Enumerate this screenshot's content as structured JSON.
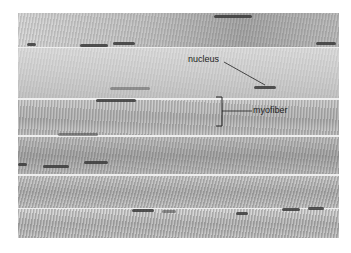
{
  "figure": {
    "labels": {
      "nucleus": "nucleus",
      "myofiber": "myofiber"
    },
    "colors": {
      "background": "#ffffff",
      "tissue": "#c9c9c9",
      "label_text": "#222222"
    }
  }
}
